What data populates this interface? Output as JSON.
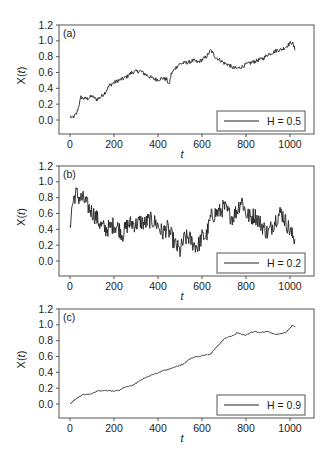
{
  "figure": {
    "width": 331,
    "height": 461,
    "frame_color": "#555555",
    "line_color": "#222222"
  },
  "chart_data": [
    {
      "type": "line",
      "panel_label": "(a)",
      "xlabel": "t",
      "ylabel": "X(t)",
      "xlim": [
        -25,
        1075
      ],
      "ylim": [
        -0.18,
        1.2
      ],
      "xticks": [
        0,
        200,
        400,
        600,
        800,
        1000
      ],
      "yticks": [
        0.0,
        0.2,
        0.4,
        0.6,
        0.8,
        1.0,
        1.2
      ],
      "ytick_labels": [
        "0.0",
        "0.2",
        "0.4",
        "0.6",
        "0.8",
        "1.0",
        "1.2"
      ],
      "legend": "H = 0.5",
      "legend_position": "lower right",
      "box": {
        "left": 59,
        "top": 25,
        "right": 314,
        "bottom": 134,
        "y0px": 120,
        "y12px": 25
      },
      "noise": 0.025,
      "series": [
        {
          "name": "H = 0.5",
          "x": [
            0,
            10,
            20,
            30,
            40,
            50,
            60,
            80,
            100,
            120,
            140,
            160,
            180,
            200,
            220,
            240,
            260,
            280,
            300,
            320,
            340,
            360,
            380,
            400,
            420,
            440,
            450,
            460,
            480,
            500,
            520,
            540,
            560,
            580,
            600,
            620,
            640,
            660,
            680,
            700,
            720,
            740,
            760,
            780,
            800,
            820,
            840,
            860,
            880,
            900,
            920,
            940,
            960,
            980,
            1000,
            1010,
            1024
          ],
          "values": [
            0.05,
            0.02,
            0.05,
            0.08,
            0.18,
            0.29,
            0.27,
            0.27,
            0.3,
            0.26,
            0.29,
            0.35,
            0.44,
            0.47,
            0.5,
            0.52,
            0.55,
            0.6,
            0.61,
            0.62,
            0.58,
            0.55,
            0.52,
            0.51,
            0.53,
            0.51,
            0.44,
            0.58,
            0.66,
            0.71,
            0.72,
            0.73,
            0.75,
            0.73,
            0.76,
            0.8,
            0.88,
            0.8,
            0.76,
            0.72,
            0.7,
            0.66,
            0.65,
            0.67,
            0.7,
            0.72,
            0.74,
            0.76,
            0.78,
            0.83,
            0.85,
            0.88,
            0.89,
            0.92,
            0.97,
            0.98,
            0.88
          ]
        }
      ]
    },
    {
      "type": "line",
      "panel_label": "(b)",
      "xlabel": "t",
      "ylabel": "X(t)",
      "xlim": [
        -25,
        1075
      ],
      "ylim": [
        -0.18,
        1.2
      ],
      "xticks": [
        0,
        200,
        400,
        600,
        800,
        1000
      ],
      "yticks": [
        0.0,
        0.2,
        0.4,
        0.6,
        0.8,
        1.0,
        1.2
      ],
      "ytick_labels": [
        "0.0",
        "0.2",
        "0.4",
        "0.6",
        "0.8",
        "1.0",
        "1.2"
      ],
      "legend": "H = 0.2",
      "legend_position": "lower right",
      "box": {
        "left": 59,
        "top": 166,
        "right": 314,
        "bottom": 276,
        "y0px": 261,
        "y12px": 166
      },
      "noise": 0.11,
      "series": [
        {
          "name": "H = 0.2",
          "x": [
            0,
            10,
            20,
            30,
            40,
            60,
            80,
            100,
            120,
            140,
            160,
            180,
            200,
            220,
            240,
            260,
            280,
            300,
            320,
            340,
            360,
            380,
            400,
            420,
            440,
            460,
            480,
            500,
            520,
            540,
            560,
            580,
            600,
            620,
            640,
            660,
            680,
            700,
            720,
            740,
            760,
            780,
            800,
            820,
            840,
            860,
            880,
            900,
            920,
            940,
            960,
            980,
            1000,
            1010,
            1024
          ],
          "values": [
            0.45,
            0.7,
            0.82,
            0.85,
            0.8,
            0.78,
            0.7,
            0.62,
            0.55,
            0.45,
            0.4,
            0.42,
            0.46,
            0.42,
            0.34,
            0.45,
            0.48,
            0.46,
            0.5,
            0.47,
            0.52,
            0.5,
            0.45,
            0.35,
            0.42,
            0.32,
            0.2,
            0.12,
            0.28,
            0.3,
            0.22,
            0.18,
            0.3,
            0.32,
            0.55,
            0.6,
            0.62,
            0.68,
            0.6,
            0.55,
            0.65,
            0.78,
            0.6,
            0.55,
            0.58,
            0.5,
            0.42,
            0.35,
            0.45,
            0.55,
            0.62,
            0.5,
            0.38,
            0.32,
            0.28
          ]
        }
      ]
    },
    {
      "type": "line",
      "panel_label": "(c)",
      "xlabel": "t",
      "ylabel": "X(t)",
      "xlim": [
        -25,
        1075
      ],
      "ylim": [
        -0.18,
        1.2
      ],
      "xticks": [
        0,
        200,
        400,
        600,
        800,
        1000
      ],
      "yticks": [
        0.0,
        0.2,
        0.4,
        0.6,
        0.8,
        1.0,
        1.2
      ],
      "ytick_labels": [
        "0.0",
        "0.2",
        "0.4",
        "0.6",
        "0.8",
        "1.0",
        "1.2"
      ],
      "legend": "H = 0.9",
      "legend_position": "lower right",
      "box": {
        "left": 59,
        "top": 309,
        "right": 314,
        "bottom": 418,
        "y0px": 404,
        "y12px": 309
      },
      "noise": 0.006,
      "series": [
        {
          "name": "H = 0.9",
          "x": [
            0,
            20,
            40,
            60,
            80,
            100,
            120,
            140,
            160,
            180,
            200,
            220,
            240,
            260,
            280,
            300,
            320,
            340,
            360,
            380,
            400,
            420,
            440,
            460,
            480,
            500,
            520,
            540,
            560,
            580,
            600,
            620,
            640,
            660,
            680,
            700,
            720,
            740,
            760,
            780,
            800,
            820,
            840,
            860,
            880,
            900,
            920,
            940,
            960,
            980,
            1000,
            1010,
            1024
          ],
          "values": [
            0.0,
            0.05,
            0.09,
            0.12,
            0.12,
            0.13,
            0.16,
            0.17,
            0.17,
            0.17,
            0.16,
            0.17,
            0.2,
            0.22,
            0.23,
            0.26,
            0.3,
            0.33,
            0.35,
            0.38,
            0.39,
            0.42,
            0.43,
            0.45,
            0.47,
            0.49,
            0.51,
            0.56,
            0.59,
            0.6,
            0.61,
            0.62,
            0.63,
            0.7,
            0.76,
            0.82,
            0.85,
            0.86,
            0.9,
            0.88,
            0.87,
            0.9,
            0.92,
            0.9,
            0.91,
            0.92,
            0.89,
            0.88,
            0.89,
            0.9,
            0.96,
            0.99,
            0.98
          ]
        }
      ]
    }
  ]
}
